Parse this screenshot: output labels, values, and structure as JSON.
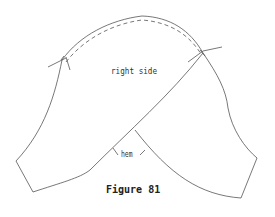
{
  "figure": {
    "caption": "Figure 81",
    "labels": {
      "right_side": "right side",
      "hem": "hem"
    },
    "line_color": "#444444"
  }
}
